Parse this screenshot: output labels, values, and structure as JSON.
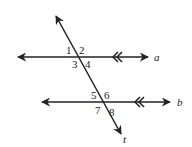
{
  "diagram": {
    "type": "parallel-lines-transversal",
    "stroke_color": "#222222",
    "lines": {
      "a": {
        "label": "a"
      },
      "b": {
        "label": "b"
      },
      "t": {
        "label": "t"
      }
    },
    "angles": {
      "a1": "1",
      "a2": "2",
      "a3": "3",
      "a4": "4",
      "a5": "5",
      "a6": "6",
      "a7": "7",
      "a8": "8"
    },
    "parallel_marker": "double-chevron"
  }
}
